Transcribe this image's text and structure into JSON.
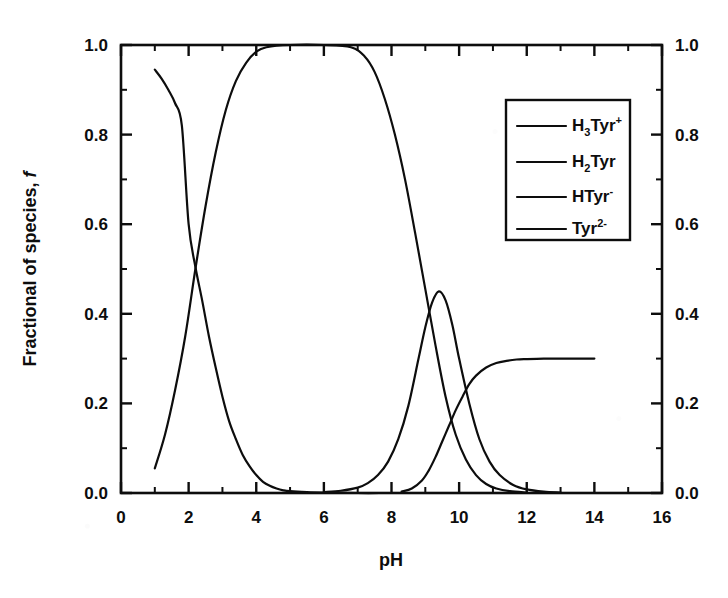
{
  "chart_data": {
    "type": "line",
    "title": "",
    "xlabel": "pH",
    "ylabel": "Fractional of species, f",
    "ylabel_plain": "Fractional of species,",
    "ylabel_italic": "f",
    "xlim": [
      0,
      16
    ],
    "ylim": [
      0.0,
      1.0
    ],
    "grid": false,
    "x_ticks": [
      0,
      2,
      4,
      6,
      8,
      10,
      12,
      14,
      16
    ],
    "x_tick_labels": [
      "0",
      "2",
      "4",
      "6",
      "8",
      "10",
      "12",
      "14",
      "16"
    ],
    "x_minor_ticks": [
      1,
      3,
      5,
      7,
      9,
      11,
      13,
      15
    ],
    "y_ticks": [
      0.0,
      0.2,
      0.4,
      0.6,
      0.8,
      1.0
    ],
    "y_tick_labels": [
      "0.0",
      "0.2",
      "0.4",
      "0.6",
      "0.8",
      "1.0"
    ],
    "y_minor_ticks": [
      0.1,
      0.3,
      0.5,
      0.7,
      0.9
    ],
    "right_axis_ticks": [
      0.0,
      0.2,
      0.4,
      0.6,
      0.8,
      1.0
    ],
    "right_axis_tick_labels": [
      "0.0",
      "0.2",
      "0.4",
      "0.6",
      "0.8",
      "1.0"
    ],
    "legend_position": "upper right",
    "line_color": "#0d0d0d",
    "series": [
      {
        "name": "H3Tyr+",
        "label_base": "H",
        "label_sub": "3",
        "label_mid": "Tyr",
        "label_sup": "+",
        "x": [
          1.0,
          1.2,
          1.4,
          1.6,
          1.8,
          2.0,
          2.2,
          2.4,
          2.6,
          2.8,
          3.0,
          3.2,
          3.4,
          3.6,
          3.8,
          4.0,
          4.2,
          4.4,
          4.6,
          4.8,
          5.0,
          5.5,
          6.0,
          7.0,
          8.0,
          9.0,
          10.0
        ],
        "values": [
          0.945,
          0.925,
          0.9,
          0.87,
          0.82,
          0.6,
          0.505,
          0.43,
          0.35,
          0.28,
          0.215,
          0.16,
          0.12,
          0.085,
          0.06,
          0.04,
          0.025,
          0.016,
          0.01,
          0.006,
          0.004,
          0.002,
          0.001,
          0.0,
          0.0,
          0.0,
          0.0
        ]
      },
      {
        "name": "H2Tyr",
        "label_base": "H",
        "label_sub": "2",
        "label_mid": "Tyr",
        "label_sup": "",
        "x": [
          1.0,
          1.3,
          1.6,
          1.9,
          2.2,
          2.5,
          2.8,
          3.1,
          3.4,
          3.7,
          4.0,
          4.3,
          5.0,
          6.0,
          6.8,
          7.2,
          7.5,
          7.8,
          8.1,
          8.4,
          8.7,
          9.0,
          9.3,
          9.6,
          9.9,
          10.2,
          10.5,
          10.8,
          11.1,
          11.5,
          12.0
        ],
        "values": [
          0.055,
          0.13,
          0.23,
          0.35,
          0.5,
          0.64,
          0.76,
          0.855,
          0.92,
          0.96,
          0.985,
          0.995,
          1.0,
          1.0,
          0.995,
          0.975,
          0.94,
          0.88,
          0.8,
          0.7,
          0.58,
          0.455,
          0.33,
          0.215,
          0.13,
          0.075,
          0.04,
          0.02,
          0.01,
          0.004,
          0.001
        ]
      },
      {
        "name": "HTyr-",
        "label_base": "HTyr",
        "label_sub": "",
        "label_mid": "",
        "label_sup": "-",
        "x": [
          6.0,
          6.5,
          7.0,
          7.3,
          7.6,
          7.9,
          8.2,
          8.5,
          8.8,
          9.0,
          9.2,
          9.4,
          9.6,
          9.8,
          10.0,
          10.3,
          10.6,
          10.9,
          11.2,
          11.6,
          12.0,
          12.5,
          13.0
        ],
        "values": [
          0.002,
          0.005,
          0.012,
          0.022,
          0.04,
          0.07,
          0.12,
          0.195,
          0.3,
          0.37,
          0.425,
          0.45,
          0.43,
          0.375,
          0.3,
          0.2,
          0.12,
          0.07,
          0.04,
          0.018,
          0.008,
          0.003,
          0.001
        ]
      },
      {
        "name": "Tyr2-",
        "label_base": "Tyr",
        "label_sub": "",
        "label_mid": "",
        "label_sup": "2-",
        "x": [
          8.3,
          8.6,
          8.9,
          9.1,
          9.3,
          9.5,
          9.7,
          9.9,
          10.1,
          10.3,
          10.5,
          10.8,
          11.1,
          11.4,
          11.7,
          12.0,
          12.5,
          13.0,
          13.5,
          14.0
        ],
        "values": [
          0.003,
          0.01,
          0.028,
          0.05,
          0.08,
          0.115,
          0.15,
          0.185,
          0.215,
          0.243,
          0.262,
          0.28,
          0.29,
          0.295,
          0.298,
          0.299,
          0.3,
          0.3,
          0.3,
          0.3
        ]
      }
    ]
  },
  "legend": {
    "entries": [
      {
        "text": "H3Tyr+"
      },
      {
        "text": "H2Tyr"
      },
      {
        "text": "HTyr-"
      },
      {
        "text": "Tyr2-"
      }
    ]
  }
}
